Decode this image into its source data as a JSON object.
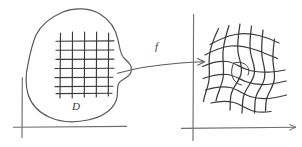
{
  "figure": {
    "type": "hand-drawn-math-diagram",
    "background_color": "#ffffff",
    "ink_color": "#4a4a4a",
    "axis_color": "#6b6b6b"
  },
  "labels": {
    "domain_label": "D",
    "map_label": "f"
  },
  "panels": {
    "left": {
      "name": "domain-panel",
      "axes": {
        "vertical": {
          "x": 22,
          "y_top": 77,
          "y_bottom": 137
        },
        "horizontal": {
          "y": 127,
          "x_left": 14,
          "x_right": 126
        }
      },
      "region": {
        "name": "domain-blob",
        "label": "D"
      },
      "grid": {
        "name": "regular-grid",
        "vertical_lines": 5,
        "horizontal_lines": 7,
        "style": "straight"
      }
    },
    "right": {
      "name": "codomain-panel",
      "axes": {
        "vertical": {
          "x": 193,
          "y_top": 14,
          "y_bottom": 140
        },
        "horizontal": {
          "y": 128,
          "x_left": 182,
          "x_right": 296
        }
      },
      "grid": {
        "name": "distorted-grid",
        "vertical_lines": 6,
        "horizontal_lines": 6,
        "style": "warped-curved-rotated"
      }
    }
  },
  "arrow": {
    "name": "mapping-arrow",
    "label": "f",
    "from": {
      "x": 118,
      "y": 72
    },
    "to": {
      "x": 205,
      "y": 68
    },
    "style": "curved-with-arrowhead"
  }
}
